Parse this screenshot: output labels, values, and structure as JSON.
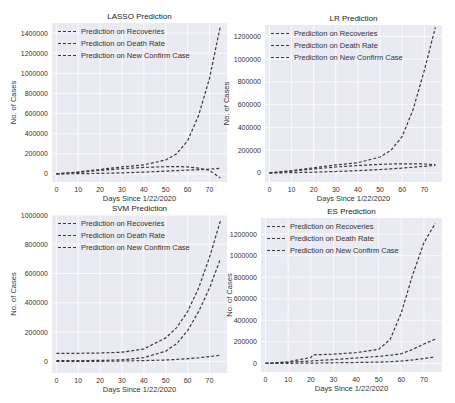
{
  "chart_data": [
    {
      "type": "line",
      "title": "LASSO Prediction",
      "xlabel": "Days Since 1/22/2020",
      "ylabel": "No. of Cases",
      "xlim": [
        -2,
        78
      ],
      "ylim": [
        -80000,
        1500000
      ],
      "xticks": [
        0,
        10,
        20,
        30,
        40,
        50,
        60,
        70
      ],
      "yticks": [
        0,
        200000,
        400000,
        600000,
        800000,
        1000000,
        1200000,
        1400000
      ],
      "legend": [
        "Prediction on Recoveries",
        "Prediction on Death Rate",
        "Prediction on New Confirm Case"
      ],
      "legend_position": "upper left",
      "grid": true,
      "x": [
        0,
        10,
        20,
        30,
        40,
        50,
        55,
        60,
        65,
        70,
        75
      ],
      "series": [
        {
          "name": "Prediction on Recoveries",
          "values": [
            0,
            2000,
            5000,
            10000,
            18000,
            28000,
            33000,
            38000,
            42000,
            48000,
            55000
          ]
        },
        {
          "name": "Prediction on Death Rate",
          "values": [
            0,
            15000,
            35000,
            52000,
            65000,
            72000,
            73000,
            70000,
            58000,
            35000,
            -40000
          ]
        },
        {
          "name": "Prediction on New Confirm Case",
          "values": [
            0,
            20000,
            45000,
            70000,
            90000,
            140000,
            200000,
            330000,
            580000,
            950000,
            1470000
          ]
        }
      ]
    },
    {
      "type": "line",
      "title": "LR Prediction",
      "xlabel": "Days Since 1/22/2020",
      "ylabel": "No. of Cases",
      "xlim": [
        -2,
        78
      ],
      "ylim": [
        -80000,
        1300000
      ],
      "xticks": [
        0,
        10,
        20,
        30,
        40,
        50,
        60,
        70
      ],
      "yticks": [
        0,
        200000,
        400000,
        600000,
        800000,
        1000000,
        1200000
      ],
      "legend": [
        "Prediction on Recoveries",
        "Prediction on Death Rate",
        "Prediction on New Confirm Case"
      ],
      "legend_position": "upper left",
      "grid": true,
      "x": [
        0,
        10,
        20,
        30,
        40,
        50,
        55,
        60,
        65,
        70,
        75
      ],
      "series": [
        {
          "name": "Prediction on Recoveries",
          "values": [
            0,
            2000,
            6000,
            12000,
            20000,
            30000,
            36000,
            42000,
            50000,
            58000,
            65000
          ]
        },
        {
          "name": "Prediction on Death Rate",
          "values": [
            0,
            15000,
            35000,
            52000,
            65000,
            75000,
            78000,
            80000,
            80000,
            78000,
            72000
          ]
        },
        {
          "name": "Prediction on New Confirm Case",
          "values": [
            0,
            20000,
            45000,
            70000,
            90000,
            140000,
            200000,
            320000,
            560000,
            900000,
            1280000
          ]
        }
      ]
    },
    {
      "type": "line",
      "title": "SVM Prediction",
      "xlabel": "Days Since 1/22/2020",
      "ylabel": "No. of Cases",
      "xlim": [
        -2,
        78
      ],
      "ylim": [
        -80000,
        1000000
      ],
      "xticks": [
        0,
        10,
        20,
        30,
        40,
        50,
        60,
        70
      ],
      "yticks": [
        0,
        200000,
        400000,
        600000,
        800000,
        1000000
      ],
      "legend": [
        "Prediction on Recoveries",
        "Prediction on Death Rate",
        "Prediction on New Confirm Case"
      ],
      "legend_position": "upper left",
      "grid": true,
      "x": [
        0,
        10,
        20,
        30,
        40,
        50,
        55,
        60,
        65,
        70,
        75
      ],
      "series": [
        {
          "name": "Prediction on Recoveries",
          "values": [
            0,
            0,
            0,
            2000,
            5000,
            9000,
            13000,
            18000,
            24000,
            32000,
            42000
          ]
        },
        {
          "name": "Prediction on Death Rate",
          "values": [
            5000,
            5000,
            6000,
            10000,
            25000,
            70000,
            120000,
            210000,
            340000,
            500000,
            700000
          ]
        },
        {
          "name": "Prediction on New Confirm Case",
          "values": [
            55000,
            55000,
            57000,
            62000,
            85000,
            160000,
            230000,
            340000,
            500000,
            710000,
            960000
          ]
        }
      ]
    },
    {
      "type": "line",
      "title": "ES Prediction",
      "xlabel": "Days Since 1/22/2020",
      "ylabel": "No. of Cases",
      "xlim": [
        -2,
        78
      ],
      "ylim": [
        -80000,
        1350000
      ],
      "xticks": [
        0,
        10,
        20,
        30,
        40,
        50,
        60,
        70
      ],
      "yticks": [
        0,
        200000,
        400000,
        600000,
        800000,
        1000000,
        1200000
      ],
      "legend": [
        "Prediction on Recoveries",
        "Prediction on Death Rate",
        "Prediction on New Confirm Case"
      ],
      "legend_position": "upper left",
      "grid": true,
      "x": [
        0,
        10,
        20,
        21,
        30,
        40,
        50,
        55,
        60,
        65,
        70,
        75
      ],
      "series": [
        {
          "name": "Prediction on Recoveries",
          "values": [
            0,
            1000,
            3000,
            3000,
            5000,
            8000,
            12000,
            16000,
            22000,
            32000,
            45000,
            60000
          ]
        },
        {
          "name": "Prediction on Death Rate",
          "values": [
            0,
            10000,
            22000,
            24000,
            35000,
            50000,
            65000,
            75000,
            90000,
            130000,
            180000,
            225000
          ]
        },
        {
          "name": "Prediction on New Confirm Case",
          "values": [
            0,
            15000,
            55000,
            80000,
            85000,
            100000,
            130000,
            220000,
            470000,
            820000,
            1120000,
            1300000
          ]
        }
      ]
    }
  ]
}
